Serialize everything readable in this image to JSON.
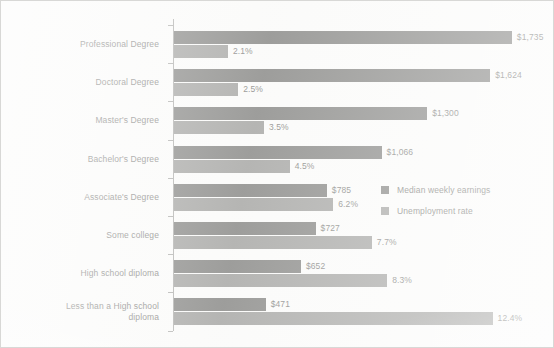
{
  "chart_data": {
    "type": "bar",
    "orientation": "horizontal",
    "title": "",
    "subtitle": "",
    "xlabel": "",
    "ylabel": "",
    "grid": false,
    "legend_position": "inside-right-middle",
    "categories": [
      "Professional Degree",
      "Doctoral Degree",
      "Master's Degree",
      "Bachelor's Degree",
      "Associate's Degree",
      "Some college",
      "High school diploma",
      "Less than a High school\ndiploma"
    ],
    "series": [
      {
        "name": "Median weekly earnings",
        "color": "#8d8d8b",
        "unit": "USD per week",
        "values": [
          1735,
          1624,
          1300,
          1066,
          785,
          727,
          652,
          471
        ],
        "labels": [
          "$1,735",
          "$1,624",
          "$1,300",
          "$1,066",
          "$785",
          "$727",
          "$652",
          "$471"
        ],
        "axis_max": 1900
      },
      {
        "name": "Unemployment rate",
        "color": "#a9a9a7",
        "unit": "percent",
        "values": [
          2.1,
          2.5,
          3.5,
          4.5,
          6.2,
          7.7,
          8.3,
          12.4
        ],
        "labels": [
          "2.1%",
          "2.5%",
          "3.5%",
          "4.5%",
          "6.2%",
          "7.7%",
          "8.3%",
          "12.4%"
        ],
        "axis_max": 14.4
      }
    ]
  },
  "legend": {
    "items": [
      {
        "label": "Median weekly earnings",
        "color": "#8d8d8b"
      },
      {
        "label": "Unemployment rate",
        "color": "#a9a9a7"
      }
    ]
  }
}
